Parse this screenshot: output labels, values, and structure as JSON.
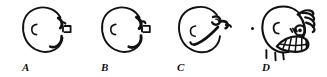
{
  "figure": {
    "background_color": "#ffffff",
    "ink_color": "#111111",
    "width": 327,
    "height": 77,
    "caption": ""
  },
  "panels": [
    {
      "id": "A",
      "label": "A",
      "center_x": 47,
      "center_y": 30,
      "radius": 24,
      "interior_mark": "C",
      "features": [
        "round-body-outline",
        "interior-c-mark",
        "upper-right-hook",
        "right-nub",
        "lower-right-crescent"
      ]
    },
    {
      "id": "B",
      "label": "B",
      "center_x": 126,
      "center_y": 30,
      "radius": 24,
      "interior_mark": "C",
      "features": [
        "round-body-outline",
        "interior-c-mark",
        "upper-right-hook",
        "right-nub",
        "lower-right-crescent"
      ]
    },
    {
      "id": "C",
      "label": "C",
      "center_x": 204,
      "center_y": 30,
      "radius": 25,
      "interior_mark": "C",
      "features": [
        "round-body-outline",
        "interior-c-mark",
        "upper-right-loop",
        "right-limb-bud",
        "diagonal-ridge"
      ]
    },
    {
      "id": "D",
      "label": "D",
      "center_x": 288,
      "center_y": 30,
      "radius": 26,
      "interior_mark": "C",
      "features": [
        "round-body-outline",
        "interior-c-mark",
        "dorsal-spines",
        "eye-spot",
        "striped-mouthparts",
        "ventral-bristles",
        "left-dot"
      ]
    }
  ],
  "labels": {
    "a": "A",
    "b": "B",
    "c": "C",
    "d": "D"
  }
}
